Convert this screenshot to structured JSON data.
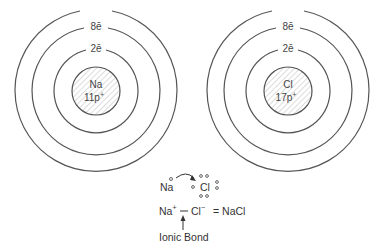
{
  "atoms": [
    {
      "symbol": "Na",
      "protons": "11p",
      "proton_charge": "+",
      "shell_labels": [
        "2ē",
        "8ē"
      ],
      "center": [
        96,
        91
      ]
    },
    {
      "symbol": "Cl",
      "protons": "17p",
      "proton_charge": "+",
      "shell_labels": [
        "2ē",
        "8ē"
      ],
      "center": [
        288,
        91
      ]
    }
  ],
  "equation": {
    "line1": {
      "left": "Na",
      "right": "Cl"
    },
    "line2": {
      "cation": "Na",
      "cation_charge": "+",
      "anion": "Cl",
      "anion_charge": "−",
      "result": "= NaCl"
    },
    "bond_label": "Ionic Bond"
  },
  "colors": {
    "stroke": "#555555",
    "text": "#333333",
    "hatch": "#bbbbbb"
  }
}
